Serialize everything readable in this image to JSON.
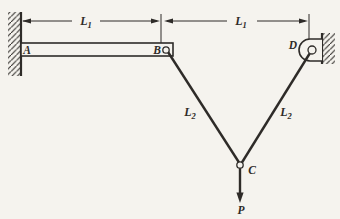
{
  "figure": {
    "type": "statics-diagram",
    "background_color": "#f5f3ee",
    "line_color": "#2e2b28",
    "joints": {
      "a": "A",
      "b": "B",
      "c": "C",
      "d": "D"
    },
    "force_label": "P",
    "dimensions": [
      {
        "symbol": "L",
        "subscript": "1"
      },
      {
        "symbol": "L",
        "subscript": "1"
      }
    ],
    "members": [
      {
        "symbol": "L",
        "subscript": "2"
      },
      {
        "symbol": "L",
        "subscript": "2"
      }
    ]
  }
}
